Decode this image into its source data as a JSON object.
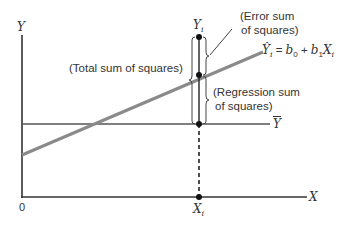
{
  "diagram": {
    "axes": {
      "y_label": "Y",
      "x_label": "X",
      "origin_label": "0"
    },
    "lines": {
      "regression_equation": "Ŷi = b0 + b1Xi",
      "regression_equation_parts": {
        "yhat": "Ŷ",
        "yhat_sub": "i",
        "equals": " = ",
        "b0": "b",
        "b0_sub": "0",
        "plus": " + ",
        "b1": "b",
        "b1_sub": "1",
        "x": "X",
        "x_sub": "i"
      },
      "mean_label": "Ȳ",
      "mean_label_base": "Y"
    },
    "points": {
      "observed_label": "Yi",
      "observed_base": "Y",
      "observed_sub": "i",
      "x_label": "Xi",
      "x_base": "X",
      "x_sub": "i"
    },
    "annotations": {
      "total": "(Total sum of squares)",
      "error_line1": "(Error sum",
      "error_line2": "of squares)",
      "regression_line1": "(Regression sum",
      "regression_line2": "of squares)"
    },
    "colors": {
      "axis": "#333333",
      "regression_line": "#8a8a8a",
      "mean_line": "#555555",
      "point": "#111111",
      "text": "#333333"
    }
  }
}
